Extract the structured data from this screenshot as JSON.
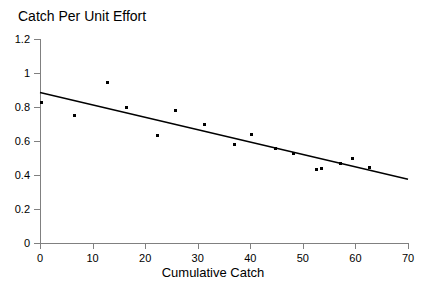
{
  "chart_data": {
    "type": "scatter",
    "title": "Catch Per Unit Effort",
    "xlabel": "Cumulative Catch",
    "ylabel": "",
    "xlim": [
      0,
      70
    ],
    "ylim": [
      0,
      1.2
    ],
    "grid": false,
    "legend": false,
    "x_ticks": [
      "0",
      "10",
      "20",
      "30",
      "40",
      "50",
      "60",
      "70"
    ],
    "x_tick_values": [
      0,
      10,
      20,
      30,
      40,
      50,
      60,
      70
    ],
    "y_ticks": [
      "0",
      "0.2",
      "0.4",
      "0.6",
      "0.8",
      "1",
      "1.2"
    ],
    "y_tick_values": [
      0,
      0.2,
      0.4,
      0.6,
      0.8,
      1,
      1.2
    ],
    "marker": "square",
    "marker_color": "#000000",
    "line_color": "#000000",
    "axis_color": "#808080",
    "series": [
      {
        "name": "observations",
        "type": "scatter",
        "points": [
          {
            "x": 0.2,
            "y": 0.825
          },
          {
            "x": 6.6,
            "y": 0.748
          },
          {
            "x": 12.9,
            "y": 0.945
          },
          {
            "x": 16.4,
            "y": 0.797
          },
          {
            "x": 22.4,
            "y": 0.632
          },
          {
            "x": 25.7,
            "y": 0.777
          },
          {
            "x": 31.3,
            "y": 0.7
          },
          {
            "x": 37.0,
            "y": 0.58
          },
          {
            "x": 40.2,
            "y": 0.638
          },
          {
            "x": 44.8,
            "y": 0.553
          },
          {
            "x": 48.2,
            "y": 0.524
          },
          {
            "x": 52.6,
            "y": 0.43
          },
          {
            "x": 53.6,
            "y": 0.436
          },
          {
            "x": 57.2,
            "y": 0.47
          },
          {
            "x": 59.4,
            "y": 0.497
          },
          {
            "x": 62.6,
            "y": 0.442
          }
        ]
      },
      {
        "name": "regression-line",
        "type": "line",
        "endpoints": [
          {
            "x": 0,
            "y": 0.885
          },
          {
            "x": 70,
            "y": 0.375
          }
        ],
        "slope": -0.00729,
        "intercept": 0.885
      }
    ]
  }
}
